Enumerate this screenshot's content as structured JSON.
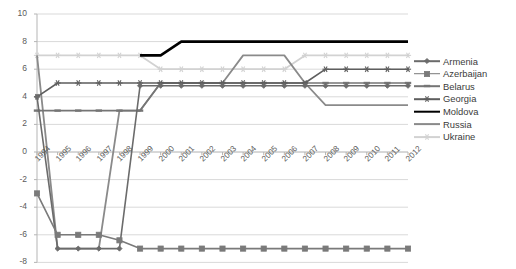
{
  "chart_data": {
    "type": "line",
    "title": "",
    "xlabel": "",
    "ylabel": "",
    "grid": true,
    "legend_position": "right",
    "ylim": [
      -8,
      10
    ],
    "yticks": [
      10,
      8,
      6,
      4,
      2,
      0,
      -2,
      -4,
      -6,
      -8
    ],
    "ytick_labels": [
      "10",
      "8",
      "6",
      "4",
      "2",
      "0",
      "-2",
      "-4",
      "-6",
      "-8"
    ],
    "categories": [
      "1994",
      "1995",
      "1996",
      "1997",
      "1998",
      "1999",
      "2000",
      "2001",
      "2002",
      "2003",
      "2004",
      "2005",
      "2006",
      "2007",
      "2008",
      "2009",
      "2010",
      "2011",
      "2012"
    ],
    "series": [
      {
        "name": "Armenia",
        "color": "#6b6b6b",
        "marker": "diamond",
        "width": 1.6,
        "values": [
          4,
          -7,
          -7,
          -7,
          -7,
          4.8,
          4.8,
          4.8,
          4.8,
          4.8,
          4.8,
          4.8,
          4.8,
          4.8,
          4.8,
          4.8,
          4.8,
          4.8,
          4.8
        ]
      },
      {
        "name": "Azerbaijan",
        "color": "#7a7a7a",
        "marker": "square",
        "width": 1.6,
        "values": [
          -3,
          -6,
          -6,
          -6,
          -6.4,
          -7,
          -7,
          -7,
          -7,
          -7,
          -7,
          -7,
          -7,
          -7,
          -7,
          -7,
          -7,
          -7,
          -7
        ]
      },
      {
        "name": "Belarus",
        "color": "#757575",
        "marker": "dash",
        "width": 1.6,
        "values": [
          3,
          3,
          3,
          3,
          3,
          3,
          5,
          5,
          5,
          5,
          5,
          5,
          5,
          5,
          5,
          5,
          5,
          5,
          5
        ]
      },
      {
        "name": "Georgia",
        "color": "#5e5e5e",
        "marker": "asterisk",
        "width": 1.6,
        "values": [
          4,
          5,
          5,
          5,
          5,
          5,
          5,
          5,
          5,
          5,
          5,
          5,
          5,
          5,
          6,
          6,
          6,
          6,
          6
        ]
      },
      {
        "name": "Moldova",
        "color": "#000000",
        "marker": "none",
        "width": 2.6,
        "values": [
          null,
          null,
          null,
          null,
          null,
          7,
          7,
          8,
          8,
          8,
          8,
          8,
          8,
          8,
          8,
          8,
          8,
          8,
          8
        ]
      },
      {
        "name": "Russia",
        "color": "#8a8a8a",
        "marker": "none",
        "width": 1.8,
        "values": [
          7,
          -7,
          -7,
          -7,
          3,
          3,
          5,
          5,
          5,
          5,
          7,
          7,
          7,
          5,
          3.4,
          3.4,
          3.4,
          3.4,
          3.4
        ]
      },
      {
        "name": "Ukraine",
        "color": "#d2d2d2",
        "marker": "asterisk",
        "width": 1.8,
        "values": [
          7,
          7,
          7,
          7,
          7,
          7,
          6,
          6,
          6,
          6,
          6,
          6,
          6,
          7,
          7,
          7,
          7,
          7,
          7
        ]
      }
    ]
  }
}
